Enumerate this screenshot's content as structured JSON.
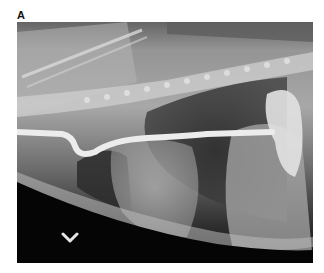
{
  "figure": {
    "panel_label": "A",
    "image_description": "Lateral thoracic radiograph showing a radiopaque feeding tube along the esophagus",
    "annotation": {
      "type": "arrowhead",
      "icon": "chevron-down-icon",
      "color": "#e6e6e6"
    },
    "colors": {
      "background": "#ffffff",
      "tube": "#ececec",
      "dark_field": "#050505"
    }
  }
}
